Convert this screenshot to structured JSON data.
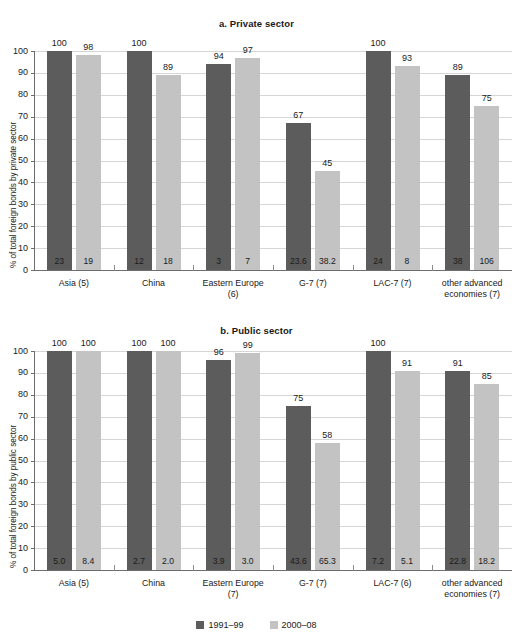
{
  "legend": {
    "series": [
      {
        "name": "1991–99",
        "color": "#5c5c5c"
      },
      {
        "name": "2000–08",
        "color": "#c3c3c3"
      }
    ]
  },
  "chart_data": [
    {
      "type": "bar",
      "panel": "a",
      "title": "a. Private sector",
      "xlabel": "",
      "ylabel": "% of total foreign bonds by private sector",
      "ylim": [
        0,
        100
      ],
      "yticks": [
        0,
        10,
        20,
        30,
        40,
        50,
        60,
        70,
        80,
        90,
        100
      ],
      "grid": true,
      "legend_position": "bottom",
      "categories": [
        "Asia (5)",
        "China",
        "Eastern Europe (6)",
        "G-7 (7)",
        "LAC-7 (7)",
        "other advanced economies (7)"
      ],
      "categories_lines": [
        [
          "Asia (5)"
        ],
        [
          "China"
        ],
        [
          "Eastern Europe",
          "(6)"
        ],
        [
          "G-7 (7)"
        ],
        [
          "LAC-7 (7)"
        ],
        [
          "other advanced",
          "economies (7)"
        ]
      ],
      "series": [
        {
          "name": "1991–99",
          "values": [
            100,
            100,
            94,
            67,
            100,
            89
          ],
          "inner_labels": [
            "23",
            "12",
            "3",
            "23.6",
            "24",
            "38"
          ]
        },
        {
          "name": "2000–08",
          "values": [
            98,
            89,
            97,
            45,
            93,
            75
          ],
          "inner_labels": [
            "19",
            "18",
            "7",
            "38.2",
            "8",
            "106"
          ]
        }
      ]
    },
    {
      "type": "bar",
      "panel": "b",
      "title": "b. Public sector",
      "xlabel": "",
      "ylabel": "% of total foreign bonds by public sector",
      "ylim": [
        0,
        100
      ],
      "yticks": [
        0,
        10,
        20,
        30,
        40,
        50,
        60,
        70,
        80,
        90,
        100
      ],
      "grid": true,
      "legend_position": "bottom",
      "categories": [
        "Asia (5)",
        "China",
        "Eastern Europe (7)",
        "G-7 (7)",
        "LAC-7 (6)",
        "other advanced economies (7)"
      ],
      "categories_lines": [
        [
          "Asia (5)"
        ],
        [
          "China"
        ],
        [
          "Eastern Europe",
          "(7)"
        ],
        [
          "G-7 (7)"
        ],
        [
          "LAC-7 (6)"
        ],
        [
          "other advanced",
          "economies (7)"
        ]
      ],
      "series": [
        {
          "name": "1991–99",
          "values": [
            100,
            100,
            96,
            75,
            100,
            91
          ],
          "inner_labels": [
            "5.0",
            "2.7",
            "3.9",
            "43.6",
            "7.2",
            "22.8"
          ]
        },
        {
          "name": "2000–08",
          "values": [
            100,
            100,
            99,
            58,
            91,
            85
          ],
          "inner_labels": [
            "8.4",
            "2.0",
            "3.0",
            "65.3",
            "5.1",
            "18.2"
          ]
        }
      ]
    }
  ]
}
